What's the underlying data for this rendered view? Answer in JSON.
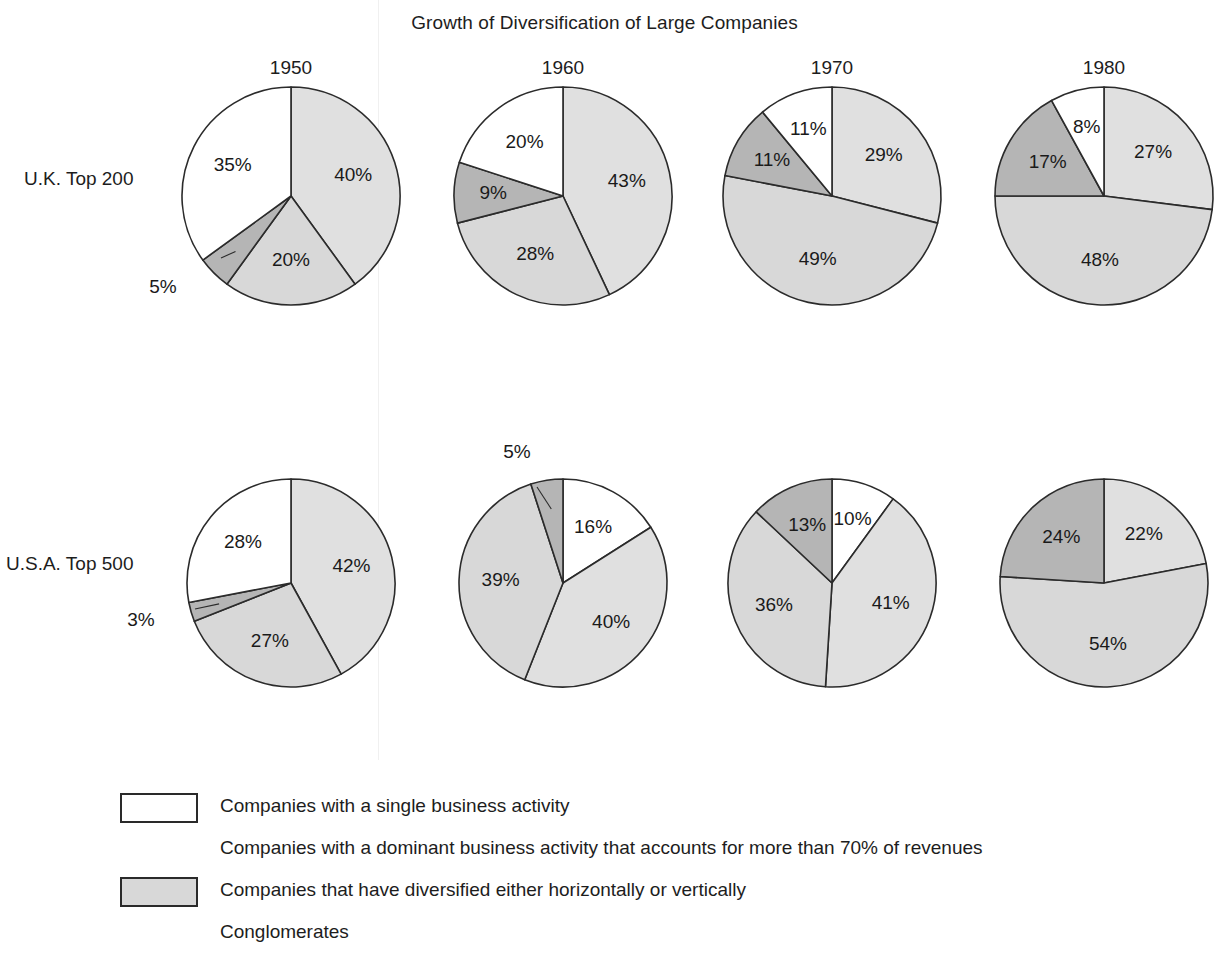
{
  "title": "Growth of Diversification of Large Companies",
  "row_labels": {
    "uk": "U.K. Top 200",
    "usa": "U.S.A. Top 500"
  },
  "years": [
    "1950",
    "1960",
    "1970",
    "1980"
  ],
  "colors": {
    "single": "#ffffff",
    "dominant": "#e0e0e0",
    "diversified": "#d8d8d8",
    "conglomerates": "#b5b5b5",
    "outline": "#2b2b2b",
    "text": "#1a1a1a"
  },
  "legend": {
    "items": [
      {
        "label": "Companies with a single business activity",
        "swatch": "single",
        "has_swatch": true
      },
      {
        "label": "Companies with a dominant business activity that accounts for more than 70% of revenues",
        "swatch": "dominant",
        "has_swatch": false
      },
      {
        "label": "Companies that have diversified either horizontally or vertically",
        "swatch": "diversified",
        "has_swatch": true
      },
      {
        "label": "Conglomerates",
        "swatch": "conglomerates",
        "has_swatch": false
      }
    ]
  },
  "chart_data": {
    "type": "pie",
    "title": "Growth of Diversification of Large Companies",
    "xlabel": "",
    "ylabel": "",
    "units": "percent",
    "categories": [
      "Companies with a single business activity",
      "Companies with a dominant business activity that accounts for more than 70% of revenues",
      "Companies that have diversified either horizontally or vertically",
      "Conglomerates"
    ],
    "rows": [
      {
        "name": "U.K. Top 200",
        "pies": [
          {
            "year": "1950",
            "slices": [
              {
                "category": "dominant",
                "value": 40,
                "label": "40%",
                "callout": false
              },
              {
                "category": "diversified",
                "value": 20,
                "label": "20%",
                "callout": false
              },
              {
                "category": "conglomerates",
                "value": 5,
                "label": "5%",
                "callout": true
              },
              {
                "category": "single",
                "value": 35,
                "label": "35%",
                "callout": false
              }
            ]
          },
          {
            "year": "1960",
            "slices": [
              {
                "category": "dominant",
                "value": 43,
                "label": "43%",
                "callout": false
              },
              {
                "category": "diversified",
                "value": 28,
                "label": "28%",
                "callout": false
              },
              {
                "category": "conglomerates",
                "value": 9,
                "label": "9%",
                "callout": false
              },
              {
                "category": "single",
                "value": 20,
                "label": "20%",
                "callout": false
              }
            ]
          },
          {
            "year": "1970",
            "slices": [
              {
                "category": "dominant",
                "value": 29,
                "label": "29%",
                "callout": false
              },
              {
                "category": "diversified",
                "value": 49,
                "label": "49%",
                "callout": false
              },
              {
                "category": "conglomerates",
                "value": 11,
                "label": "11%",
                "callout": false
              },
              {
                "category": "single",
                "value": 11,
                "label": "11%",
                "callout": false
              }
            ]
          },
          {
            "year": "1980",
            "slices": [
              {
                "category": "dominant",
                "value": 27,
                "label": "27%",
                "callout": false
              },
              {
                "category": "diversified",
                "value": 48,
                "label": "48%",
                "callout": false
              },
              {
                "category": "conglomerates",
                "value": 17,
                "label": "17%",
                "callout": false
              },
              {
                "category": "single",
                "value": 8,
                "label": "8%",
                "callout": false
              }
            ]
          }
        ]
      },
      {
        "name": "U.S.A. Top 500",
        "pies": [
          {
            "year": "1950",
            "slices": [
              {
                "category": "dominant",
                "value": 42,
                "label": "42%",
                "callout": false
              },
              {
                "category": "diversified",
                "value": 27,
                "label": "27%",
                "callout": false
              },
              {
                "category": "conglomerates",
                "value": 3,
                "label": "3%",
                "callout": true
              },
              {
                "category": "single",
                "value": 28,
                "label": "28%",
                "callout": false
              }
            ]
          },
          {
            "year": "1960",
            "slices": [
              {
                "category": "single",
                "value": 16,
                "label": "16%",
                "callout": false
              },
              {
                "category": "dominant",
                "value": 40,
                "label": "40%",
                "callout": false
              },
              {
                "category": "diversified",
                "value": 39,
                "label": "39%",
                "callout": false
              },
              {
                "category": "conglomerates",
                "value": 5,
                "label": "5%",
                "callout": true
              }
            ]
          },
          {
            "year": "1970",
            "slices": [
              {
                "category": "single",
                "value": 10,
                "label": "10%",
                "callout": false
              },
              {
                "category": "dominant",
                "value": 41,
                "label": "41%",
                "callout": false
              },
              {
                "category": "diversified",
                "value": 36,
                "label": "36%",
                "callout": false
              },
              {
                "category": "conglomerates",
                "value": 13,
                "label": "13%",
                "callout": false
              }
            ]
          },
          {
            "year": "1980",
            "slices": [
              {
                "category": "dominant",
                "value": 22,
                "label": "22%",
                "callout": false
              },
              {
                "category": "diversified",
                "value": 54,
                "label": "54%",
                "callout": false
              },
              {
                "category": "conglomerates",
                "value": 24,
                "label": "24%",
                "callout": false
              }
            ]
          }
        ]
      }
    ]
  }
}
